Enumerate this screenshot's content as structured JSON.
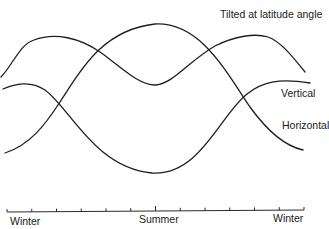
{
  "chart_data": {
    "type": "line",
    "title": "",
    "xlabel": "",
    "ylabel": "",
    "grid": false,
    "legend_position": "inline-right",
    "categories": [
      "Winter",
      "",
      "",
      "",
      "",
      "",
      "Summer",
      "",
      "",
      "",
      "",
      "",
      "Winter"
    ],
    "x_tick_labels": [
      "Winter",
      "Summer",
      "Winter"
    ],
    "x_tick_count": 13,
    "y_units": "relative (no axis scale shown)",
    "ylim": [
      0,
      100
    ],
    "series": [
      {
        "name": "Tilted at latitude angle",
        "values": [
          68,
          88,
          86,
          76,
          62,
          52,
          49,
          52,
          62,
          78,
          89,
          86,
          70
        ]
      },
      {
        "name": "Vertical",
        "values": [
          57,
          58,
          47,
          30,
          15,
          6,
          4,
          6,
          14,
          34,
          58,
          60,
          58
        ]
      },
      {
        "name": "Horizontal",
        "values": [
          12,
          24,
          48,
          72,
          88,
          96,
          98,
          95,
          86,
          64,
          40,
          20,
          12
        ]
      }
    ],
    "annotations": [
      "Tilted at latitude angle",
      "Vertical",
      "Horizontal"
    ]
  },
  "labels": {
    "tilted": "Tilted at latitude angle",
    "vertical": "Vertical",
    "horizontal": "Horizontal",
    "axis_left": "Winter",
    "axis_mid": "Summer",
    "axis_right": "Winter"
  }
}
